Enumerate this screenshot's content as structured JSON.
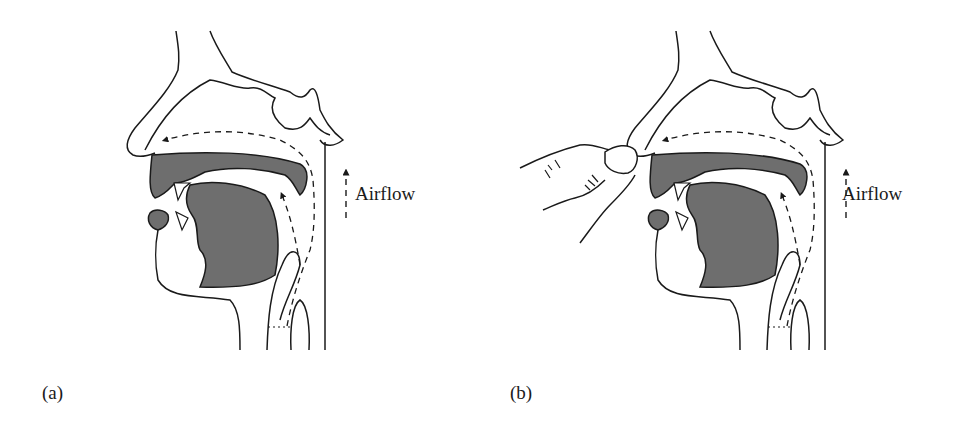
{
  "figure": {
    "panels": [
      {
        "id": "a",
        "label": "(a)",
        "airflow_label": "Airflow",
        "hand_present": false
      },
      {
        "id": "b",
        "label": "(b)",
        "airflow_label": "Airflow",
        "hand_present": true
      }
    ],
    "colors": {
      "line": "#1a1a1a",
      "fill": "#6e6e6e",
      "background": "#ffffff"
    }
  }
}
